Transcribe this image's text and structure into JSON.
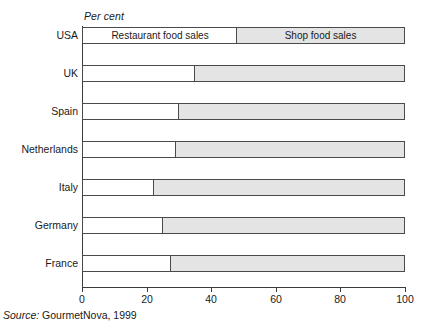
{
  "figure": {
    "unit_label": "Per cent",
    "source_prefix": "Source:",
    "source_text": "GourmetNova, 1999"
  },
  "axis": {
    "ticks": [
      {
        "value": 0,
        "label": "0"
      },
      {
        "value": 20,
        "label": "20"
      },
      {
        "value": 40,
        "label": "40"
      },
      {
        "value": 60,
        "label": "60"
      },
      {
        "value": 80,
        "label": "80"
      },
      {
        "value": 100,
        "label": "100"
      }
    ]
  },
  "inbar_legend": {
    "restaurant": "Restaurant food sales",
    "shop": "Shop food sales"
  },
  "colors": {
    "restaurant_fill": "#ffffff",
    "shop_fill": "#e4e4e4",
    "bar_stroke": "#4a4a4a",
    "axis": "#3b3b3b",
    "text": "#1a1a1a"
  },
  "chart_data": {
    "type": "bar",
    "orientation": "horizontal",
    "stacked": true,
    "stack_total": 100,
    "title": "",
    "xlabel": "Per cent",
    "ylabel": "",
    "xlim": [
      0,
      100
    ],
    "grid": false,
    "legend_position": "in-bar-first-row",
    "categories": [
      "USA",
      "UK",
      "Spain",
      "Netherlands",
      "Italy",
      "Germany",
      "France"
    ],
    "series": [
      {
        "name": "Restaurant food sales",
        "values": [
          48,
          35,
          30,
          29,
          22,
          25,
          27.5
        ]
      },
      {
        "name": "Shop food sales",
        "values": [
          52,
          65,
          70,
          71,
          78,
          75,
          72.5
        ]
      }
    ],
    "annotations": [
      "Per cent",
      "Source: GourmetNova, 1999"
    ]
  }
}
